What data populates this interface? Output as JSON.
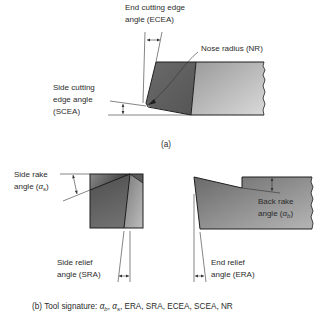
{
  "figure": {
    "part_a": {
      "caption": "(a)",
      "labels": {
        "ecea_line1": "End cutting edge",
        "ecea_line2": "angle (ECEA)",
        "nose_radius": "Nose radius (NR)",
        "scea_line1": "Side cutting",
        "scea_line2": "edge angle",
        "scea_line3": "(SCEA)"
      }
    },
    "part_b": {
      "labels": {
        "side_rake_line1": "Side rake",
        "side_rake_line2_prefix": "angle (",
        "side_rake_symbol": "α",
        "side_rake_subscript": "s",
        "side_rake_suffix": ")",
        "side_relief_line1": "Side relief",
        "side_relief_line2": "angle (SRA)",
        "back_rake_line1": "Back rake",
        "back_rake_line2_prefix": "angle (",
        "back_rake_symbol": "α",
        "back_rake_subscript": "b",
        "back_rake_suffix": ")",
        "end_relief_line1": "End relief",
        "end_relief_line2": "angle (ERA)"
      },
      "caption": {
        "prefix": "(b) Tool signature: ",
        "alpha": "α",
        "sub_b": "b",
        "sep1": ", ",
        "sub_s": "s",
        "rest": ", ERA, SRA, ECEA, SCEA, NR"
      }
    },
    "colors": {
      "tool_dark": "#5e5e5e",
      "tool_light": "#c8c8c8",
      "outline": "#1e1e1e",
      "text": "#2b2b2b"
    }
  }
}
